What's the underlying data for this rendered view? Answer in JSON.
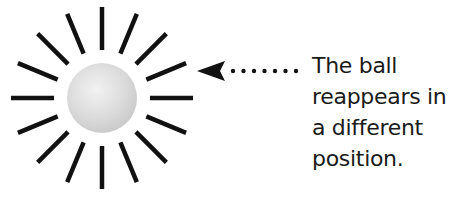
{
  "diagram": {
    "burst": {
      "center": [
        102,
        98
      ],
      "ray_count": 16,
      "ray_inner_radius": 48,
      "ray_outer_radius": 91,
      "ray_color": "#111111"
    },
    "ball": {
      "radius": 35,
      "highlight_color": "#f2f2f2",
      "shade_color": "#c9c9c9"
    },
    "arrow": {
      "direction": "left",
      "tip": [
        197,
        71
      ],
      "dot_count": 7,
      "color": "#111111"
    },
    "caption": {
      "lines": [
        "The ball",
        "reappears in",
        "a different",
        "position."
      ]
    }
  }
}
